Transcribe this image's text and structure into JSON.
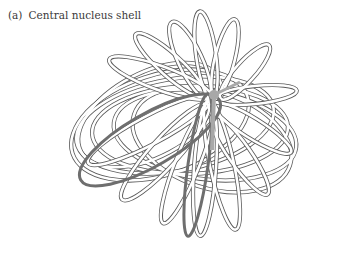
{
  "figure": {
    "label": "(a)",
    "title": "Central nucleus shell",
    "hub": {
      "x": 214,
      "y": 95
    },
    "colors": {
      "ribbon_fill": "#ffffff",
      "ribbon_edge": "#555555",
      "highlight_fill": "#6e6e6e",
      "hub_fill": "#a8a8a8"
    }
  }
}
